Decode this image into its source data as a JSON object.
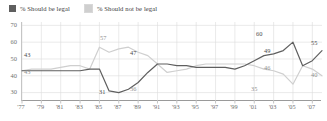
{
  "legend": {
    "items": [
      {
        "label": "% Should be legal",
        "color": "#5f5f5f",
        "name": "legal"
      },
      {
        "label": "% Should not be legal",
        "color": "#cfcfcf",
        "name": "not-legal"
      }
    ]
  },
  "axis": {
    "y_ticks": [
      "70",
      "60",
      "50",
      "40",
      "30"
    ],
    "x_ticks": [
      "'77",
      "'79",
      "'81",
      "'83",
      "'85",
      "'87",
      "'89",
      "'91",
      "'93",
      "'95",
      "'97",
      "'99",
      "'01",
      "'03",
      "'05",
      "'07"
    ]
  },
  "annotations": [
    {
      "text": "43",
      "series": "legal",
      "x": 24,
      "y": 52
    },
    {
      "text": "43",
      "series": "not-legal",
      "x": 24,
      "y": 69
    },
    {
      "text": "57",
      "series": "not-legal",
      "x": 100,
      "y": 35
    },
    {
      "text": "31",
      "series": "legal",
      "x": 99,
      "y": 89
    },
    {
      "text": "47",
      "series": "legal",
      "x": 130,
      "y": 50
    },
    {
      "text": "36",
      "series": "not-legal",
      "x": 130,
      "y": 86
    },
    {
      "text": "60",
      "series": "legal",
      "x": 256,
      "y": 31
    },
    {
      "text": "49",
      "series": "legal",
      "x": 264,
      "y": 48
    },
    {
      "text": "46",
      "series": "not-legal",
      "x": 264,
      "y": 65
    },
    {
      "text": "35",
      "series": "not-legal",
      "x": 251,
      "y": 86
    },
    {
      "text": "55",
      "series": "legal",
      "x": 311,
      "y": 40
    },
    {
      "text": "40",
      "series": "not-legal",
      "x": 311,
      "y": 72
    }
  ],
  "chart_data": {
    "type": "line",
    "title": "",
    "xlabel": "",
    "ylabel": "",
    "ylim": [
      25,
      72
    ],
    "xlim": [
      1977,
      2008
    ],
    "grid": true,
    "legend_position": "top-left",
    "x": [
      1977,
      1978,
      1979,
      1980,
      1981,
      1982,
      1983,
      1984,
      1985,
      1986,
      1987,
      1988,
      1989,
      1990,
      1991,
      1992,
      1993,
      1994,
      1995,
      1996,
      1997,
      1998,
      1999,
      2000,
      2001,
      2002,
      2003,
      2004,
      2005,
      2006,
      2007,
      2008
    ],
    "series": [
      {
        "name": "% Should be legal",
        "color": "#5f5f5f",
        "values": [
          43,
          43,
          43,
          43,
          43,
          43,
          43,
          44,
          44,
          31,
          30,
          32,
          36,
          42,
          47,
          47,
          46,
          46,
          45,
          45,
          45,
          45,
          44,
          46,
          49,
          52,
          53,
          55,
          60,
          46,
          49,
          55
        ]
      },
      {
        "name": "% Should not be legal",
        "color": "#cfcfcf",
        "values": [
          43,
          44,
          44,
          44,
          45,
          46,
          46,
          44,
          57,
          54,
          56,
          57,
          54,
          52,
          47,
          42,
          43,
          44,
          46,
          47,
          47,
          47,
          47,
          47,
          46,
          44,
          43,
          41,
          35,
          46,
          44,
          40
        ]
      }
    ]
  }
}
